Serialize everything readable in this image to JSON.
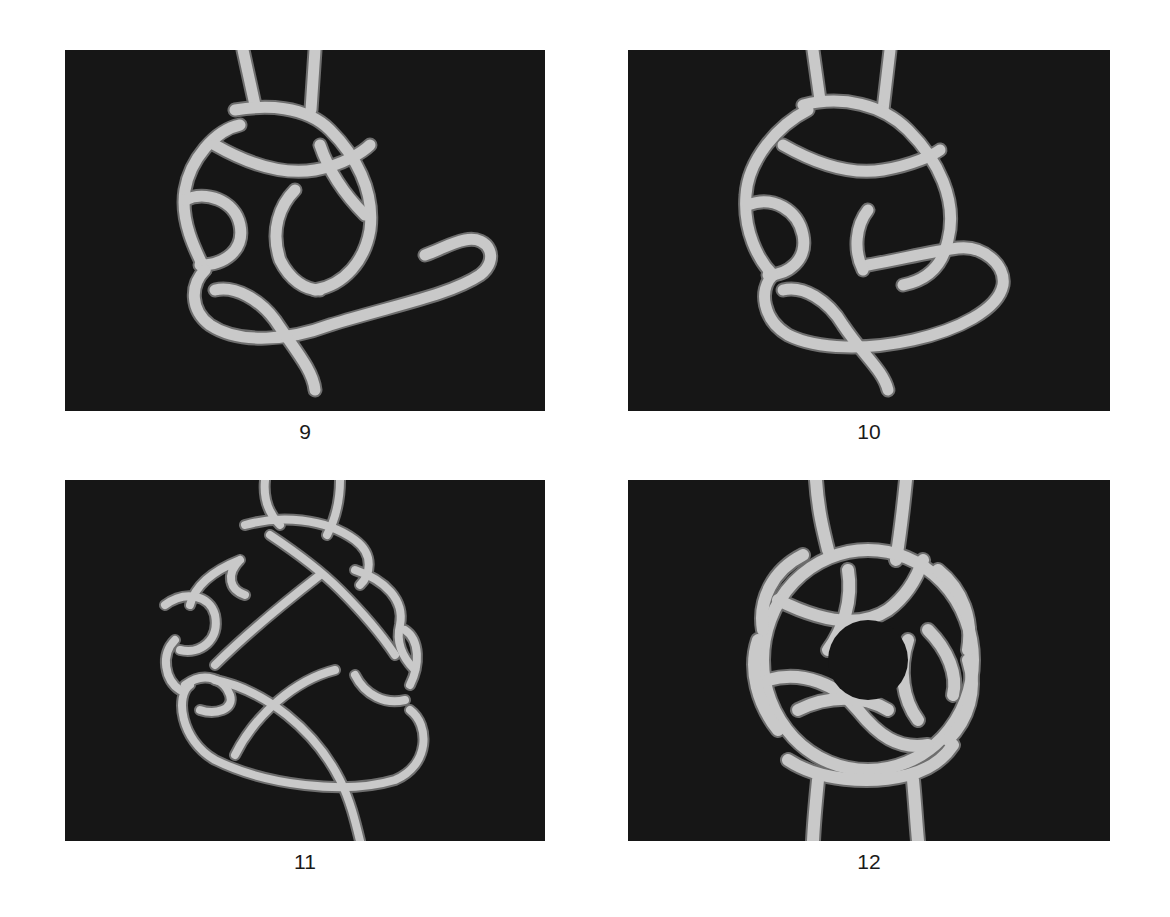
{
  "figures": [
    {
      "id": "9",
      "caption": "9",
      "subject": "knot-tying step photo: working end looped out to the right, loose tail ending mid-panel"
    },
    {
      "id": "10",
      "caption": "10",
      "subject": "knot-tying step photo: working end tucked back into the center of the knot"
    },
    {
      "id": "11",
      "caption": "11",
      "subject": "knot-tying step photo: loose, open pattern with rope crossing through the bottom"
    },
    {
      "id": "12",
      "caption": "12",
      "subject": "knot-tying step photo: finished tightened round knot with standing parts above and below"
    }
  ],
  "colors": {
    "photo_background": "#161616",
    "rope": "#c9c9c9",
    "rope_shadow": "#6e6e6e",
    "caption_text": "#1a1a1a"
  }
}
